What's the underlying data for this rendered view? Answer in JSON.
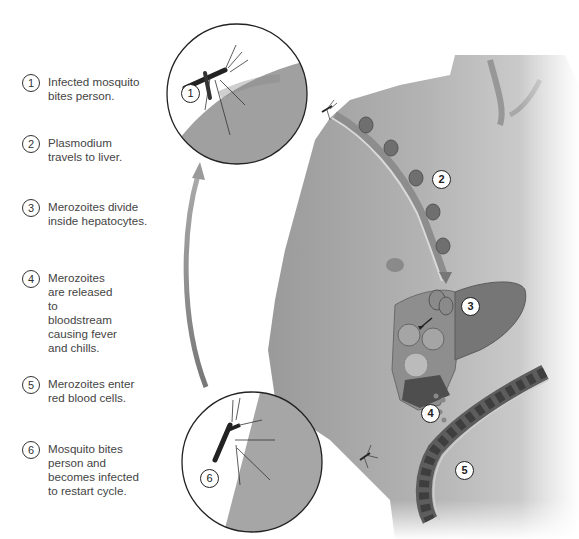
{
  "diagram": {
    "colors": {
      "skin": "#a9a9a9",
      "skin_dark": "#7d7d7d",
      "liver": "#8a8a8a",
      "vessel": "#5a5a5a",
      "ink": "#333333"
    },
    "steps": [
      {
        "number": "1",
        "text": "Infected mosquito bites person."
      },
      {
        "number": "2",
        "text": "Plasmodium travels to liver."
      },
      {
        "number": "3",
        "text": "Merozoites divide inside hepatocytes."
      },
      {
        "number": "4",
        "text": "Merozoites are released to bloodstream causing fever and chills."
      },
      {
        "number": "5",
        "text": "Merozoites enter red blood cells."
      },
      {
        "number": "6",
        "text": "Mosquito bites person and becomes infected to restart cycle."
      }
    ],
    "callouts": [
      {
        "number": "1",
        "label": "mosquito-bite-inset"
      },
      {
        "number": "2",
        "label": "plasmodium-path"
      },
      {
        "number": "3",
        "label": "liver"
      },
      {
        "number": "4",
        "label": "merozoite-release"
      },
      {
        "number": "5",
        "label": "blood-vessel"
      },
      {
        "number": "6",
        "label": "mosquito-feeding-inset"
      }
    ]
  }
}
